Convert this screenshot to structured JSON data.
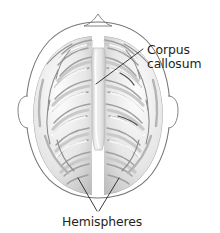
{
  "figure": {
    "background_color": "#ffffff",
    "outline_color": "#6f6f6f",
    "leader_line_color": "#1a1a1a",
    "text_color": "#231f20",
    "brain_light": "#fbfbfb",
    "brain_mid": "#d8d8d8",
    "brain_shadow": "#a8a8a8",
    "fissure_color": "#ffffff"
  },
  "labels": {
    "corpus_callosum": {
      "line1": "Corpus",
      "line2": "callosum"
    },
    "hemispheres": {
      "text": "Hemispheres"
    }
  },
  "anatomy": {
    "structures": [
      "head-outline",
      "nose",
      "left-ear",
      "right-ear",
      "left-hemisphere",
      "right-hemisphere",
      "longitudinal-fissure",
      "corpus-callosum"
    ]
  }
}
